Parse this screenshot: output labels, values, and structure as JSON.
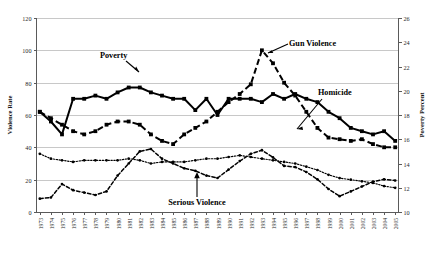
{
  "chart_data": {
    "type": "line",
    "title": "",
    "xlabel": "",
    "ylabel": "Violence Rate",
    "y2label": "Poverty Percent",
    "grid": true,
    "legend_position": "inline-annotations",
    "ylim": [
      0,
      120
    ],
    "y2lim": [
      10,
      26
    ],
    "yticks": [
      0,
      20,
      40,
      60,
      80,
      100,
      120
    ],
    "y2ticks": [
      10,
      12,
      14,
      16,
      18,
      20,
      22,
      24,
      26
    ],
    "x": [
      1973,
      1974,
      1975,
      1976,
      1977,
      1978,
      1979,
      1980,
      1981,
      1982,
      1983,
      1984,
      1985,
      1986,
      1987,
      1988,
      1989,
      1990,
      1991,
      1992,
      1993,
      1994,
      1995,
      1996,
      1997,
      1998,
      1999,
      2000,
      2001,
      2002,
      2003,
      2004,
      2005
    ],
    "categories": [
      "1973",
      "1974",
      "1975",
      "1976",
      "1977",
      "1978",
      "1979",
      "1980",
      "1981",
      "1982",
      "1983",
      "1984",
      "1985",
      "1986",
      "1987",
      "1988",
      "1989",
      "1990",
      "1991",
      "1992",
      "1993",
      "1994",
      "1995",
      "1996",
      "1997",
      "1998",
      "1999",
      "2000",
      "2001",
      "2002",
      "2003",
      "2004",
      "2005"
    ],
    "series": [
      {
        "name": "Serious Violence",
        "axis": "left",
        "style": "dotted-small",
        "marker": "dot",
        "values": [
          36,
          33,
          32,
          31,
          32,
          32,
          32,
          32,
          33,
          32,
          30,
          31,
          31,
          31,
          32,
          33,
          33,
          34,
          35,
          34,
          33,
          32,
          31,
          30,
          28,
          26,
          23,
          21,
          20,
          19,
          18,
          16,
          15
        ]
      },
      {
        "name": "Homicide",
        "axis": "left",
        "style": "dashed",
        "marker": "square",
        "values": [
          62,
          58,
          54,
          50,
          48,
          50,
          54,
          56,
          56,
          54,
          48,
          44,
          42,
          48,
          52,
          56,
          62,
          68,
          73,
          79,
          100,
          92,
          80,
          72,
          62,
          52,
          46,
          45,
          44,
          45,
          42,
          40,
          40
        ]
      },
      {
        "name": "Gun Violence",
        "axis": "left",
        "style": "solid",
        "marker": "square",
        "values": [
          62,
          56,
          48,
          70,
          70,
          72,
          70,
          74,
          77,
          77,
          74,
          72,
          70,
          70,
          63,
          70,
          60,
          70,
          70,
          70,
          68,
          73,
          70,
          73,
          70,
          68,
          62,
          58,
          52,
          50,
          48,
          50,
          44
        ]
      },
      {
        "name": "Poverty",
        "axis": "right",
        "style": "dot-dash",
        "marker": "dot",
        "values": [
          11.1,
          11.2,
          12.3,
          11.8,
          11.6,
          11.4,
          11.7,
          13.0,
          14.0,
          15.0,
          15.2,
          14.4,
          14.0,
          13.6,
          13.4,
          13.0,
          12.8,
          13.5,
          14.2,
          14.8,
          15.1,
          14.5,
          13.8,
          13.7,
          13.3,
          12.7,
          11.9,
          11.3,
          11.7,
          12.1,
          12.5,
          12.7,
          12.6
        ]
      }
    ],
    "annotations": [
      {
        "label": "Poverty",
        "x": 1982,
        "target_series": "Poverty"
      },
      {
        "label": "Gun Violence",
        "x": 1993,
        "target_series": "Gun Violence"
      },
      {
        "label": "Homicide",
        "x": 1997,
        "target_series": "Homicide"
      },
      {
        "label": "Serious Violence",
        "x": 1989,
        "target_series": "Serious Violence"
      }
    ]
  },
  "axes": {
    "left_title": "Violence Rate",
    "right_title": "Poverty Percent",
    "left_ticks": [
      "0",
      "20",
      "40",
      "60",
      "80",
      "100",
      "120"
    ],
    "right_ticks": [
      "10",
      "12",
      "14",
      "16",
      "18",
      "20",
      "22",
      "24",
      "26"
    ],
    "x_ticks": [
      "1973",
      "1974",
      "1975",
      "1976",
      "1977",
      "1978",
      "1979",
      "1980",
      "1981",
      "1982",
      "1983",
      "1984",
      "1985",
      "1986",
      "1987",
      "1988",
      "1989",
      "1990",
      "1991",
      "1992",
      "1993",
      "1994",
      "1995",
      "1996",
      "1997",
      "1998",
      "1999",
      "2000",
      "2001",
      "2002",
      "2003",
      "2004",
      "2005"
    ]
  },
  "labels": {
    "poverty": "Poverty",
    "gun_violence": "Gun Violence",
    "homicide": "Homicide",
    "serious_violence": "Serious Violence"
  },
  "colors": {
    "series_stroke": "#000000",
    "grid": "#c8c8c8",
    "axis": "#5a5a5a",
    "background": "#ffffff"
  }
}
